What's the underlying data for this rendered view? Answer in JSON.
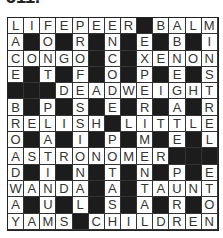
{
  "title": "511.",
  "grid": {
    "rows": 13,
    "cols": 13,
    "cells": [
      "LIFEPEER#BALM",
      "A#O#R#N#E#B#I",
      "CONGO#C#XENON",
      "E#T#F#O#P#E#S",
      "###DEADWEIGHT",
      "B#P#S#E#R#A#R",
      "RELISH#LITTLE",
      "O#A#I#P#M#E#L",
      "ASTRONOMER###",
      "D#I#N#T#N#P#E",
      "WANDA#A#TAUNT",
      "A#U#L#S#A#R#O",
      "YAMS#CHILDREN"
    ]
  },
  "colors": {
    "block": "#1c1c1c",
    "cell": "#ffffff",
    "letter": "#333333"
  }
}
